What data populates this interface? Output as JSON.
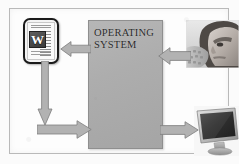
{
  "figure": {
    "frame_color": "#b9b9b9",
    "background_color": "#fdfdfd"
  },
  "os_box": {
    "label": "OPERATING\nSYSTEM",
    "fill_color": "#adadad",
    "border_color": "#8f8f8f"
  },
  "application": {
    "name": "word-document-icon",
    "letter": "W",
    "border_color": "#1b1b1b",
    "page_color": "#fafafa"
  },
  "user": {
    "name": "person-at-keyboard-photo",
    "description": "man looking down at keyboard"
  },
  "display": {
    "name": "computer-monitor-photo",
    "description": "flat panel monitor"
  },
  "arrows": [
    {
      "id": "os-to-application",
      "direction": "left",
      "from": "operating-system",
      "to": "application"
    },
    {
      "id": "application-down",
      "direction": "down",
      "from": "application",
      "to": "elbow"
    },
    {
      "id": "application-to-os",
      "direction": "right",
      "from": "elbow",
      "to": "operating-system"
    },
    {
      "id": "user-to-os",
      "direction": "left",
      "from": "user",
      "to": "operating-system"
    },
    {
      "id": "os-to-display",
      "direction": "right",
      "from": "operating-system",
      "to": "display"
    }
  ],
  "arrow_style": {
    "fill_color": "#b2b2b2",
    "stroke_color": "#7d7d7d"
  }
}
